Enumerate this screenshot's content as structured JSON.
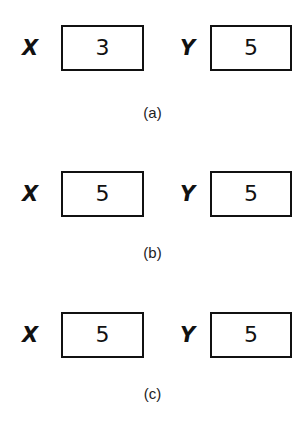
{
  "panels": [
    {
      "x_label": "X",
      "x_value": "3",
      "y_label": "Y",
      "y_value": "5",
      "caption": "(a)"
    },
    {
      "x_label": "X",
      "x_value": "5",
      "y_label": "Y",
      "y_value": "5",
      "caption": "(b)"
    },
    {
      "x_label": "X",
      "x_value": "5",
      "y_label": "Y",
      "y_value": "5",
      "caption": "(c)"
    }
  ]
}
